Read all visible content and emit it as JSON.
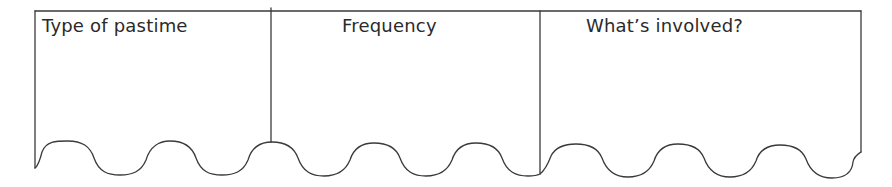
{
  "table": {
    "columns": [
      {
        "header": "Type of pastime"
      },
      {
        "header": "Frequency"
      },
      {
        "header": "What’s involved?"
      }
    ]
  },
  "colors": {
    "line": "#3a3a3a",
    "text": "#2a2a2a",
    "background": "#ffffff"
  }
}
